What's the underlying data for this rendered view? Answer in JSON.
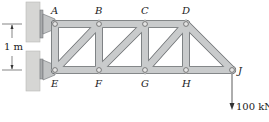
{
  "figure": {
    "type": "truss-diagram",
    "dimension": {
      "label": "1 m",
      "span": "vertical distance between top chord A-D and bottom chord E-J"
    },
    "load": {
      "label": "100 kN",
      "at_joint": "J",
      "direction": "down"
    },
    "joints": [
      {
        "id": "A",
        "label": "A",
        "x": 55,
        "y": 24
      },
      {
        "id": "B",
        "label": "B",
        "x": 99,
        "y": 24
      },
      {
        "id": "C",
        "label": "C",
        "x": 145,
        "y": 24
      },
      {
        "id": "D",
        "label": "D",
        "x": 186,
        "y": 24
      },
      {
        "id": "E",
        "label": "E",
        "x": 55,
        "y": 70
      },
      {
        "id": "F",
        "label": "F",
        "x": 99,
        "y": 70
      },
      {
        "id": "G",
        "label": "G",
        "x": 145,
        "y": 70
      },
      {
        "id": "H",
        "label": "H",
        "x": 186,
        "y": 70
      },
      {
        "id": "J",
        "label": "J",
        "x": 232,
        "y": 70
      }
    ],
    "members": [
      [
        "A",
        "B"
      ],
      [
        "B",
        "C"
      ],
      [
        "C",
        "D"
      ],
      [
        "E",
        "F"
      ],
      [
        "F",
        "G"
      ],
      [
        "G",
        "H"
      ],
      [
        "H",
        "J"
      ],
      [
        "A",
        "E"
      ],
      [
        "B",
        "F"
      ],
      [
        "C",
        "G"
      ],
      [
        "D",
        "H"
      ],
      [
        "E",
        "B"
      ],
      [
        "F",
        "C"
      ],
      [
        "G",
        "D"
      ],
      [
        "D",
        "J"
      ]
    ],
    "supports": [
      {
        "at_joint": "A",
        "type": "wall-pin"
      },
      {
        "at_joint": "E",
        "type": "wall-pin"
      }
    ],
    "colors": {
      "member_fill": "#c9cbcc",
      "member_stroke": "#6d7073",
      "wall_fill": "#d6d6d4",
      "pin_fill": "#e4e4e4",
      "text": "#222222"
    }
  }
}
